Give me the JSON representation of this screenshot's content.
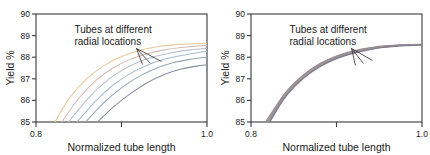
{
  "figure": {
    "panels": [
      {
        "id": "left-panel",
        "name": "fanned-curves-panel",
        "annotation": {
          "line1": "Tubes at different",
          "line2": "radial locations"
        }
      },
      {
        "id": "right-panel",
        "name": "bundled-curves-panel",
        "annotation": {
          "line1": "Tubes at different",
          "line2": "radial locations"
        }
      }
    ]
  },
  "chart_data": [
    {
      "type": "line",
      "title": "",
      "xlabel": "Normalized tube length",
      "ylabel": "Yield %",
      "xlim": [
        0.8,
        1.0
      ],
      "ylim": [
        85,
        90
      ],
      "xticks": [
        0.8,
        0.9,
        1.0
      ],
      "xticklabels": [
        "0.8",
        "",
        "1.0"
      ],
      "yticks": [
        85,
        86,
        87,
        88,
        89,
        90
      ],
      "yticklabels": [
        "85",
        "86",
        "87",
        "88",
        "89",
        "90"
      ],
      "grid": false,
      "legend": null,
      "annotations": [
        {
          "text": "Tubes at different radial locations",
          "x": 0.845,
          "y": 89.1,
          "leader_lines": 3
        }
      ],
      "series": [
        {
          "name": "tube-1",
          "color": "#e8c89a",
          "x": [
            0.822,
            0.84,
            0.86,
            0.88,
            0.9,
            0.92,
            0.94,
            0.96,
            0.98,
            1.0
          ],
          "values": [
            85.0,
            86.15,
            87.02,
            87.62,
            88.03,
            88.3,
            88.47,
            88.57,
            88.62,
            88.65
          ]
        },
        {
          "name": "tube-2",
          "color": "#d9b9b0",
          "x": [
            0.83,
            0.85,
            0.87,
            0.89,
            0.91,
            0.93,
            0.95,
            0.97,
            1.0
          ],
          "values": [
            85.0,
            86.1,
            86.92,
            87.5,
            87.9,
            88.16,
            88.34,
            88.45,
            88.55
          ]
        },
        {
          "name": "tube-3",
          "color": "#b9bfd4",
          "x": [
            0.838,
            0.86,
            0.88,
            0.9,
            0.92,
            0.94,
            0.96,
            0.98,
            1.0
          ],
          "values": [
            85.0,
            86.05,
            86.82,
            87.38,
            87.78,
            88.04,
            88.22,
            88.34,
            88.42
          ]
        },
        {
          "name": "tube-4",
          "color": "#a8bccc",
          "x": [
            0.848,
            0.87,
            0.89,
            0.91,
            0.93,
            0.95,
            0.97,
            1.0
          ],
          "values": [
            85.0,
            85.98,
            86.7,
            87.24,
            87.63,
            87.9,
            88.08,
            88.28
          ]
        },
        {
          "name": "tube-5",
          "color": "#9aa8b4",
          "x": [
            0.858,
            0.88,
            0.9,
            0.92,
            0.94,
            0.96,
            0.98,
            1.0
          ],
          "values": [
            85.0,
            85.92,
            86.58,
            87.1,
            87.48,
            87.74,
            87.9,
            88.0
          ]
        },
        {
          "name": "tube-6",
          "color": "#8a8f9c",
          "x": [
            0.872,
            0.89,
            0.91,
            0.93,
            0.95,
            0.97,
            0.99,
            1.0
          ],
          "values": [
            85.0,
            85.68,
            86.3,
            86.82,
            87.2,
            87.45,
            87.6,
            87.64
          ]
        }
      ]
    },
    {
      "type": "line",
      "title": "",
      "xlabel": "Normalized tube length",
      "ylabel": "Yield %",
      "xlim": [
        0.8,
        1.0
      ],
      "ylim": [
        85,
        90
      ],
      "xticks": [
        0.8,
        0.9,
        1.0
      ],
      "xticklabels": [
        "0.8",
        "",
        "1.0"
      ],
      "yticks": [
        85,
        86,
        87,
        88,
        89,
        90
      ],
      "yticklabels": [
        "85",
        "86",
        "87",
        "88",
        "89",
        "90"
      ],
      "grid": false,
      "legend": null,
      "annotations": [
        {
          "text": "Tubes at different radial locations",
          "x": 0.845,
          "y": 89.1,
          "leader_lines": 3
        }
      ],
      "series": [
        {
          "name": "tube-1",
          "color": "#9b8f8c",
          "x": [
            0.817,
            0.84,
            0.86,
            0.88,
            0.9,
            0.92,
            0.94,
            0.96,
            0.98,
            1.0
          ],
          "values": [
            85.0,
            86.35,
            87.15,
            87.7,
            88.06,
            88.3,
            88.45,
            88.54,
            88.58,
            88.6
          ]
        },
        {
          "name": "tube-2",
          "color": "#8f8a94",
          "x": [
            0.818,
            0.84,
            0.86,
            0.88,
            0.9,
            0.92,
            0.94,
            0.96,
            0.98,
            1.0
          ],
          "values": [
            85.0,
            86.3,
            87.11,
            87.66,
            88.03,
            88.27,
            88.43,
            88.52,
            88.57,
            88.59
          ]
        },
        {
          "name": "tube-3",
          "color": "#a09498",
          "x": [
            0.819,
            0.84,
            0.86,
            0.88,
            0.9,
            0.92,
            0.94,
            0.96,
            0.98,
            1.0
          ],
          "values": [
            85.0,
            86.26,
            87.07,
            87.63,
            88.0,
            88.25,
            88.41,
            88.5,
            88.56,
            88.58
          ]
        },
        {
          "name": "tube-4",
          "color": "#94909c",
          "x": [
            0.82,
            0.84,
            0.86,
            0.88,
            0.9,
            0.92,
            0.94,
            0.96,
            0.98,
            1.0
          ],
          "values": [
            85.0,
            86.22,
            87.03,
            87.6,
            87.97,
            88.22,
            88.39,
            88.49,
            88.55,
            88.58
          ]
        },
        {
          "name": "tube-5",
          "color": "#8c8893",
          "x": [
            0.821,
            0.84,
            0.86,
            0.88,
            0.9,
            0.92,
            0.94,
            0.96,
            0.98,
            1.0
          ],
          "values": [
            85.0,
            86.18,
            87.0,
            87.57,
            87.95,
            88.2,
            88.37,
            88.48,
            88.54,
            88.57
          ]
        },
        {
          "name": "tube-6",
          "color": "#7f7b86",
          "x": [
            0.822,
            0.84,
            0.86,
            0.88,
            0.9,
            0.92,
            0.94,
            0.96,
            0.98,
            1.0
          ],
          "values": [
            85.0,
            86.14,
            86.97,
            87.54,
            87.93,
            88.18,
            88.36,
            88.47,
            88.53,
            88.56
          ]
        }
      ]
    }
  ]
}
